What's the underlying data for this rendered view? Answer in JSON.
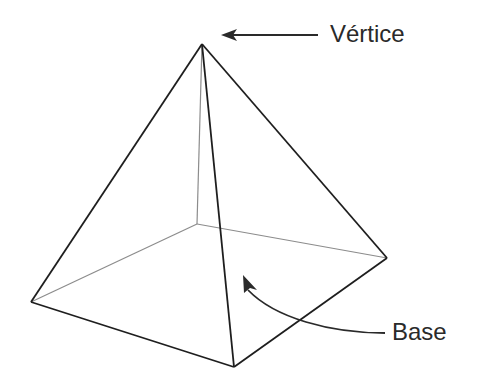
{
  "diagram": {
    "labels": {
      "vertex": "Vértice",
      "base": "Base"
    },
    "colors": {
      "edge_visible": "#1e1e1e",
      "edge_hidden": "#8c8c8c",
      "arrow": "#2a2a2a",
      "text": "#2a2a2a",
      "background": "#ffffff"
    },
    "points": {
      "apex": [
        202,
        44
      ],
      "base_back": [
        197,
        224
      ],
      "base_left": [
        31,
        302
      ],
      "base_right": [
        387,
        258
      ],
      "base_front": [
        234,
        367
      ]
    }
  }
}
